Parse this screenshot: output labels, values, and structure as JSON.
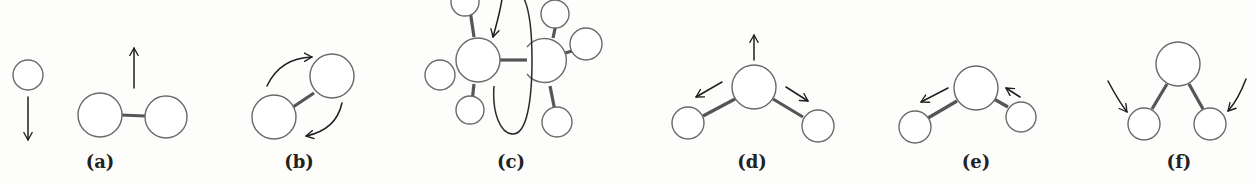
{
  "figure": {
    "panels": [
      {
        "id": "a",
        "label": "(a)",
        "depicts": "translation of an atom and of a diatomic molecule"
      },
      {
        "id": "b",
        "label": "(b)",
        "depicts": "rotation of a diatomic molecule"
      },
      {
        "id": "c",
        "label": "(c)",
        "depicts": "internal rotation (torsion) about a C-C bond"
      },
      {
        "id": "d",
        "label": "(d)",
        "depicts": "symmetric stretch of a bent triatomic molecule"
      },
      {
        "id": "e",
        "label": "(e)",
        "depicts": "asymmetric stretch of a bent triatomic molecule"
      },
      {
        "id": "f",
        "label": "(f)",
        "depicts": "bending mode of a bent triatomic molecule"
      }
    ]
  },
  "colors": {
    "background": "#fdfdfb",
    "atom_outline": "#6a6a6a",
    "bond": "#555555",
    "arrow": "#1e1e1e"
  }
}
